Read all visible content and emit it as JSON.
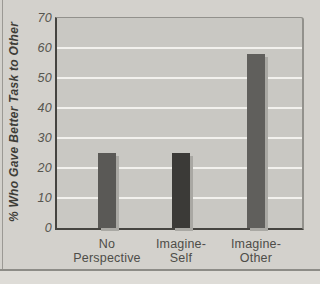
{
  "chart_data": {
    "type": "bar",
    "title": "",
    "xlabel": "",
    "ylabel": "% Who Gave Better Task to Other",
    "categories": [
      "No\nPerspective",
      "Imagine-\nSelf",
      "Imagine-\nOther"
    ],
    "values": [
      25,
      25,
      58
    ],
    "ylim": [
      0,
      70
    ],
    "yticks": [
      0,
      10,
      20,
      30,
      40,
      50,
      60,
      70
    ],
    "grid": true,
    "gridline_values": [
      10,
      20,
      30,
      40,
      50,
      60
    ],
    "legend": null,
    "colors": {
      "bars": [
        "#5a5956",
        "#3b3a37",
        "#605f5c"
      ],
      "bar_shadow": "#a9a8a3",
      "plot_background": "#c9c8c3",
      "figure_background": "#d3d1cc",
      "page_background": "#dedcd7",
      "gridline": "#f2f1ed",
      "axis": "#454440",
      "border": "#92918c",
      "tick_text": "#56554f",
      "label_text": "#4e4d48",
      "title_text": "#3e3d38"
    }
  }
}
